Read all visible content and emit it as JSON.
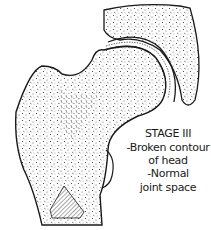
{
  "diagram": {
    "caption": {
      "title": "STAGE III",
      "lines": [
        "-Broken contour",
        "of head",
        "-Normal",
        "joint space"
      ]
    },
    "colors": {
      "ink": "#1a1a1a",
      "background": "#ffffff"
    }
  }
}
